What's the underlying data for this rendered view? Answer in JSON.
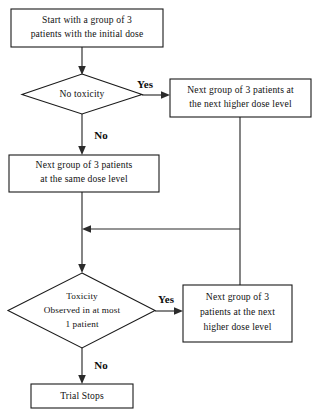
{
  "diagram": {
    "background_color": "#ffffff",
    "line_color": "#2b2b2b",
    "text_color": "#111111",
    "nodes": [
      {
        "id": "start",
        "type": "process",
        "lines": [
          "Start with a group of  3",
          "patients with the initial dose"
        ]
      },
      {
        "id": "decision-no-toxicity",
        "type": "decision",
        "lines": [
          "No toxicity"
        ]
      },
      {
        "id": "escalate-top",
        "type": "process",
        "lines": [
          "Next group of  3 patients at",
          "the  next higher  dose  level"
        ]
      },
      {
        "id": "same-dose",
        "type": "process",
        "lines": [
          "Next  group  of 3 patients",
          "at  the  same  dose  level"
        ]
      },
      {
        "id": "decision-toxicity-at-most-one",
        "type": "decision",
        "lines": [
          "Toxicity",
          "Observed in at most",
          "1 patient"
        ]
      },
      {
        "id": "escalate-bottom",
        "type": "process",
        "lines": [
          "Next  group  of  3",
          "patients at the next",
          "higher dose level"
        ]
      },
      {
        "id": "trial-stops",
        "type": "terminator",
        "lines": [
          "Trial Stops"
        ]
      }
    ],
    "branch_labels": {
      "yes_top": "Yes",
      "no_top": "No",
      "yes_bottom": "Yes",
      "no_bottom": "No"
    }
  }
}
